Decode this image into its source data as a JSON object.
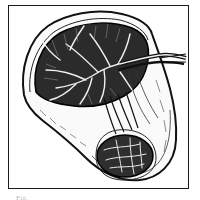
{
  "figure": {
    "type": "anatomical line illustration",
    "style": "black ink engraving on white",
    "frame_color": "#1a1a1a",
    "ink_color": "#111111",
    "background_color": "#ffffff",
    "caption_text": "Fig."
  }
}
